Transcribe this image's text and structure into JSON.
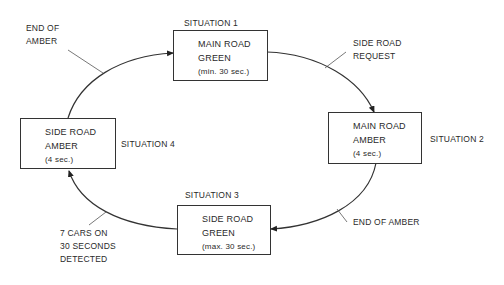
{
  "diagram": {
    "type": "state-cycle",
    "colors": {
      "line": "#333333",
      "text": "#2a2a2a",
      "background": "#ffffff"
    },
    "states": [
      {
        "id": "s1",
        "situation": "SITUATION 1",
        "line1": "MAIN ROAD",
        "line2": "GREEN",
        "line3": "(min. 30 sec.)"
      },
      {
        "id": "s2",
        "situation": "SITUATION 2",
        "line1": "MAIN ROAD",
        "line2": "AMBER",
        "line3": "(4 sec.)"
      },
      {
        "id": "s3",
        "situation": "SITUATION 3",
        "line1": "SIDE ROAD",
        "line2": "GREEN",
        "line3": "(max. 30 sec.)"
      },
      {
        "id": "s4",
        "situation": "SITUATION 4",
        "line1": "SIDE ROAD",
        "line2": "AMBER",
        "line3": "(4 sec.)"
      }
    ],
    "transitions": [
      {
        "from": "s1",
        "to": "s2",
        "line1": "SIDE ROAD",
        "line2": "REQUEST"
      },
      {
        "from": "s2",
        "to": "s3",
        "line1": "END OF AMBER"
      },
      {
        "from": "s3",
        "to": "s4",
        "line1": "7 CARS ON",
        "line2": "30 SECONDS",
        "line3": "DETECTED"
      },
      {
        "from": "s4",
        "to": "s1",
        "line1": "END OF",
        "line2": "AMBER"
      }
    ]
  }
}
